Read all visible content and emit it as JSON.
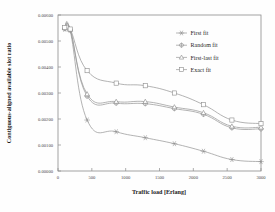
{
  "chart_data": {
    "type": "line",
    "title": "",
    "xlabel": "Traffic load [Erlang]",
    "ylabel": "Contiguous-aligned available slot ratio",
    "xlim": [
      0,
      3000
    ],
    "ylim": [
      0.0,
      0.006
    ],
    "xticks": [
      0,
      500,
      1000,
      1500,
      2000,
      2500,
      3000
    ],
    "xticklabels": [
      "0",
      "500",
      "1000",
      "1500",
      "2000",
      "2500",
      "3000"
    ],
    "yticks": [
      0.0,
      0.001,
      0.002,
      0.003,
      0.004,
      0.005,
      0.006
    ],
    "yticklabels": [
      "0.00000",
      "0.00100",
      "0.00200",
      "0.00300",
      "0.00400",
      "0.00500",
      "0.00600"
    ],
    "grid": false,
    "legend_position": "upper right inside",
    "x": [
      100,
      180,
      430,
      860,
      1290,
      1720,
      2150,
      2570,
      3000
    ],
    "series": [
      {
        "name": "First fit",
        "marker": "star",
        "values": [
          0.00545,
          0.0054,
          0.00196,
          0.00151,
          0.00128,
          0.00105,
          0.00076,
          0.00044,
          0.00036
        ]
      },
      {
        "name": "Random fit",
        "marker": "cross-circle",
        "values": [
          0.00548,
          0.00543,
          0.00288,
          0.00261,
          0.00259,
          0.0024,
          0.00218,
          0.00166,
          0.00162
        ]
      },
      {
        "name": "First-last fit",
        "marker": "triangle",
        "values": [
          0.0055,
          0.00544,
          0.00296,
          0.00267,
          0.00267,
          0.00246,
          0.00224,
          0.00172,
          0.00168
        ]
      },
      {
        "name": "Exact fit",
        "marker": "square",
        "values": [
          0.00552,
          0.00546,
          0.00386,
          0.00338,
          0.00328,
          0.003,
          0.00255,
          0.00196,
          0.00182
        ]
      }
    ]
  },
  "legend": {
    "items": [
      {
        "label": "First fit"
      },
      {
        "label": "Random fit"
      },
      {
        "label": "First-last fit"
      },
      {
        "label": "Exact fit"
      }
    ]
  },
  "colors": {
    "line": "#9a9a9a",
    "axis": "#8d8d8d",
    "text": "#2a2a2a",
    "background": "#fefefe"
  }
}
